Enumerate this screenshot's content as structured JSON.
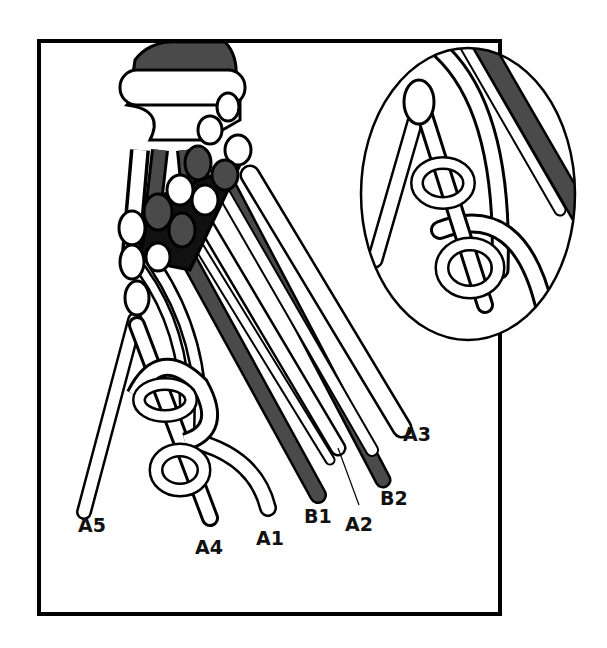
{
  "figure": {
    "type": "macrame-knot-illustration",
    "colors": {
      "dark_cord": "#4a4a4a",
      "light_cord": "#ffffff",
      "outline": "#000000",
      "background": "#ffffff"
    },
    "labels": [
      {
        "id": "A5",
        "text": "A5",
        "x": 78,
        "y": 532
      },
      {
        "id": "A4",
        "text": "A4",
        "x": 195,
        "y": 554
      },
      {
        "id": "A1",
        "text": "A1",
        "x": 256,
        "y": 545
      },
      {
        "id": "B1",
        "text": "B1",
        "x": 304,
        "y": 523
      },
      {
        "id": "A2",
        "text": "A2",
        "x": 345,
        "y": 531
      },
      {
        "id": "B2",
        "text": "B2",
        "x": 380,
        "y": 505
      },
      {
        "id": "A3",
        "text": "A3",
        "x": 403,
        "y": 441
      }
    ],
    "inset": {
      "description": "magnified detail of knot chain"
    }
  }
}
